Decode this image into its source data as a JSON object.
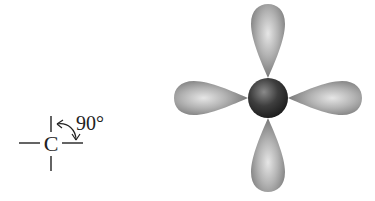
{
  "structure": {
    "atom_symbol": "C",
    "angle_label": "90°"
  },
  "orbital_model": {
    "lobes": [
      "top",
      "right",
      "bottom",
      "left"
    ],
    "nucleus_color": "#3a3a3a",
    "lobe_color": "#9a9a9a"
  }
}
